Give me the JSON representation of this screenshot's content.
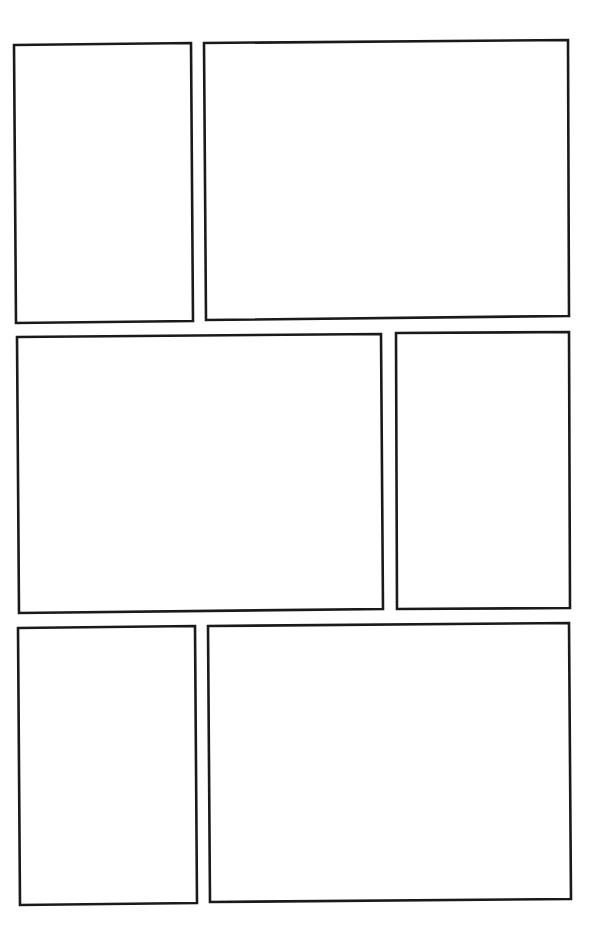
{
  "page": {
    "type": "comic-panel-template",
    "background": "#ffffff",
    "border_color": "#1a1a1a",
    "rows": [
      {
        "panels": [
          {
            "id": "panel-1",
            "points": "14,45 191,43 193,321 16,323"
          },
          {
            "id": "panel-2",
            "points": "204,43 568,40 569,316 206,320"
          }
        ]
      },
      {
        "panels": [
          {
            "id": "panel-3",
            "points": "17,337 381,334 383,609 19,613"
          },
          {
            "id": "panel-4",
            "points": "396,333 569,332 570,608 397,609"
          }
        ]
      },
      {
        "panels": [
          {
            "id": "panel-5",
            "points": "18,628 195,626 197,903 20,905"
          },
          {
            "id": "panel-6",
            "points": "208,626 569,623 571,899 210,902"
          }
        ]
      }
    ]
  }
}
